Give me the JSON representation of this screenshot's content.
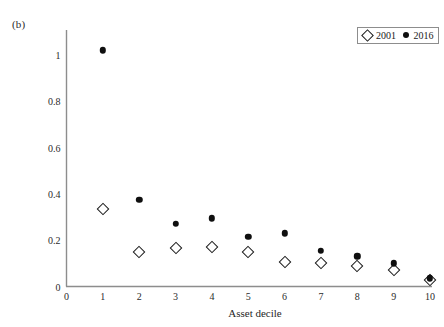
{
  "panel": {
    "label": "(b)"
  },
  "legend": {
    "entries": [
      {
        "label": "2001",
        "marker": "open-diamond-icon"
      },
      {
        "label": "2016",
        "marker": "filled-circle-icon"
      }
    ]
  },
  "axes": {
    "x_title": "Asset decile",
    "y_title": "",
    "x_ticks": [
      "0",
      "1",
      "2",
      "3",
      "4",
      "5",
      "6",
      "7",
      "8",
      "9",
      "10"
    ],
    "y_ticks": [
      "0",
      "0.2",
      "0.4",
      "0.6",
      "0.8",
      "1"
    ]
  },
  "colors": {
    "axis": "#8d8d8d",
    "text": "#1f1f1f",
    "marker_2016": "#0f0f0f",
    "marker_2001_stroke": "#1a1a1a",
    "marker_2001_fill": "#ffffff",
    "background": "#ffffff",
    "legend_border": "#8d8d8d"
  },
  "chart_data": {
    "type": "scatter",
    "title": "",
    "xlabel": "Asset decile",
    "ylabel": "",
    "xlim": [
      0,
      10
    ],
    "ylim": [
      0,
      1.1
    ],
    "xticks": [
      0,
      1,
      2,
      3,
      4,
      5,
      6,
      7,
      8,
      9,
      10
    ],
    "yticks": [
      0,
      0.2,
      0.4,
      0.6,
      0.8,
      1
    ],
    "grid": false,
    "legend_position": "top-right",
    "x": [
      1,
      2,
      3,
      4,
      5,
      6,
      7,
      8,
      9,
      10
    ],
    "series": [
      {
        "name": "2001",
        "marker": "open-diamond",
        "values": [
          0.335,
          0.15,
          0.165,
          0.17,
          0.15,
          0.105,
          0.1,
          0.09,
          0.07,
          0.03
        ]
      },
      {
        "name": "2016",
        "marker": "filled-circle",
        "values": [
          1.02,
          0.375,
          0.27,
          0.295,
          0.215,
          0.23,
          0.155,
          0.13,
          0.1,
          0.035
        ]
      }
    ]
  }
}
